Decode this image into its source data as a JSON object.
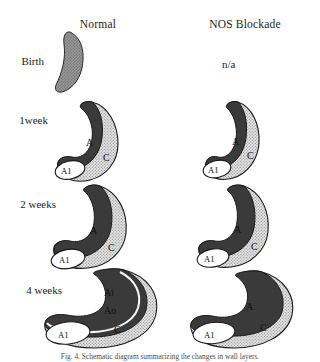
{
  "figure": {
    "columns": [
      {
        "id": "normal",
        "label": "Normal"
      },
      {
        "id": "nos",
        "label": "NOS Blockade"
      }
    ],
    "rows": [
      {
        "id": "birth",
        "label": "Birth"
      },
      {
        "id": "w1",
        "label": "1week"
      },
      {
        "id": "w2",
        "label": "2 weeks"
      },
      {
        "id": "w4",
        "label": "4 weeks"
      }
    ],
    "na_text": "n/a",
    "caption": "Fig. 4. Schematic diagram summarizing the changes in wall layers.",
    "region_labels": {
      "A": "A",
      "C": "C",
      "A1": "A1",
      "Ai": "Ai",
      "Ao": "Ao"
    },
    "cells": {
      "birth_normal": {
        "regions": [
          "uniform-gray"
        ],
        "labels": []
      },
      "birth_nos": {
        "regions": [],
        "labels": [
          "n/a"
        ]
      },
      "w1_normal": {
        "regions": [
          "A",
          "C",
          "A1"
        ],
        "labels": [
          "A",
          "C",
          "A1"
        ]
      },
      "w1_nos": {
        "regions": [
          "A",
          "C",
          "A1"
        ],
        "labels": [
          "A",
          "C",
          "A1"
        ]
      },
      "w2_normal": {
        "regions": [
          "A",
          "C",
          "A1"
        ],
        "labels": [
          "A",
          "C",
          "A1"
        ]
      },
      "w2_nos": {
        "regions": [
          "A",
          "C",
          "A1"
        ],
        "labels": [
          "A",
          "C",
          "A1"
        ]
      },
      "w4_normal": {
        "regions": [
          "Ai",
          "Ao",
          "C",
          "A1"
        ],
        "labels": [
          "Ai",
          "Ao",
          "C",
          "A1"
        ]
      },
      "w4_nos": {
        "regions": [
          "A",
          "C",
          "A1"
        ],
        "labels": [
          "A",
          "C",
          "A1"
        ]
      }
    }
  },
  "colors": {
    "dark_media": "#3a3a3a",
    "birth_gray": "#8f8f8f",
    "stipple_light": "#d5d5d5",
    "white_intima": "#ffffff",
    "outline": "#1a1a1a",
    "text": "#1d1d1d"
  }
}
